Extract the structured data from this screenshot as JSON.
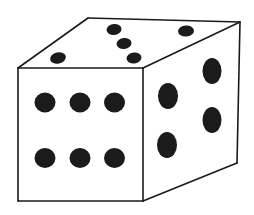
{
  "figure": {
    "name": "rectangular-die",
    "background_color": "#ffffff",
    "outline_color": "#1a1a1a",
    "pip_color": "#1b1b1b",
    "outline_width": 1.6
  },
  "faces": [
    {
      "id": "front-face",
      "label": "front face",
      "pip_count": 6,
      "fill": "#ffffff",
      "polygon": "18,68 143,68 143,201 18,201"
    },
    {
      "id": "top-face",
      "label": "top face",
      "pip_count": 5,
      "fill": "#ffffff",
      "polygon": "18,68 88,18 240,22 143,68"
    },
    {
      "id": "right-face",
      "label": "right face",
      "pip_count": 4,
      "fill": "#ffffff",
      "polygon": "143,68 240,22 237,163 143,201"
    }
  ],
  "pips": {
    "front": [
      {
        "id": "front-pip-1",
        "cx": 45.0,
        "cy": 102.5,
        "rx": 10.5,
        "ry": 10.0,
        "rotate": 0
      },
      {
        "id": "front-pip-2",
        "cx": 80.0,
        "cy": 102.5,
        "rx": 10.5,
        "ry": 10.0,
        "rotate": 0
      },
      {
        "id": "front-pip-3",
        "cx": 114.5,
        "cy": 102.5,
        "rx": 10.5,
        "ry": 10.0,
        "rotate": 0
      },
      {
        "id": "front-pip-4",
        "cx": 45.0,
        "cy": 158.0,
        "rx": 10.5,
        "ry": 10.0,
        "rotate": 0
      },
      {
        "id": "front-pip-5",
        "cx": 80.0,
        "cy": 158.0,
        "rx": 10.5,
        "ry": 10.0,
        "rotate": 0
      },
      {
        "id": "front-pip-6",
        "cx": 114.5,
        "cy": 158.0,
        "rx": 10.5,
        "ry": 10.0,
        "rotate": 0
      }
    ],
    "top": [
      {
        "id": "top-pip-1",
        "cx": 58.0,
        "cy": 58.0,
        "rx": 8.0,
        "ry": 5.5,
        "rotate": -12
      },
      {
        "id": "top-pip-2",
        "cx": 114.0,
        "cy": 29.5,
        "rx": 7.5,
        "ry": 5.5,
        "rotate": -6
      },
      {
        "id": "top-pip-3",
        "cx": 124.0,
        "cy": 43.5,
        "rx": 7.5,
        "ry": 5.5,
        "rotate": -6
      },
      {
        "id": "top-pip-4",
        "cx": 134.0,
        "cy": 58.0,
        "rx": 7.5,
        "ry": 5.5,
        "rotate": -6
      },
      {
        "id": "top-pip-5",
        "cx": 186.0,
        "cy": 31.0,
        "rx": 8.0,
        "ry": 5.5,
        "rotate": -4
      }
    ],
    "right": [
      {
        "id": "right-pip-1",
        "cx": 168.0,
        "cy": 96.0,
        "rx": 10.0,
        "ry": 13.0,
        "rotate": 0
      },
      {
        "id": "right-pip-2",
        "cx": 212.0,
        "cy": 71.0,
        "rx": 9.5,
        "ry": 13.0,
        "rotate": 0
      },
      {
        "id": "right-pip-3",
        "cx": 167.0,
        "cy": 145.0,
        "rx": 10.0,
        "ry": 13.0,
        "rotate": 0
      },
      {
        "id": "right-pip-4",
        "cx": 212.0,
        "cy": 120.0,
        "rx": 9.5,
        "ry": 13.0,
        "rotate": 0
      }
    ]
  },
  "edges": {
    "front_top": {
      "x1": 18,
      "y1": 68,
      "x2": 143,
      "y2": 68
    },
    "front_left": {
      "x1": 18,
      "y1": 68,
      "x2": 18,
      "y2": 201
    },
    "front_bottom": {
      "x1": 18,
      "y1": 201,
      "x2": 143,
      "y2": 201
    },
    "front_right": {
      "x1": 143,
      "y1": 68,
      "x2": 143,
      "y2": 201
    },
    "top_left": {
      "x1": 18,
      "y1": 68,
      "x2": 88,
      "y2": 18
    },
    "top_back": {
      "x1": 88,
      "y1": 18,
      "x2": 240,
      "y2": 22
    },
    "top_right": {
      "x1": 240,
      "y1": 22,
      "x2": 143,
      "y2": 68
    },
    "right_back": {
      "x1": 240,
      "y1": 22,
      "x2": 237,
      "y2": 163
    },
    "right_bottom": {
      "x1": 237,
      "y1": 163,
      "x2": 143,
      "y2": 201
    }
  }
}
